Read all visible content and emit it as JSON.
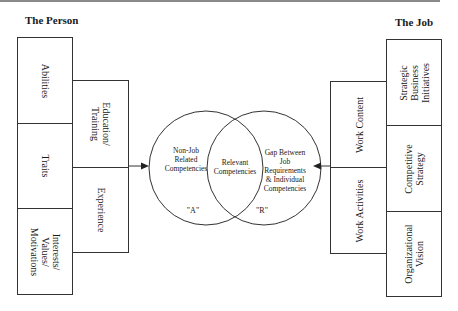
{
  "headings": {
    "left": "The Person",
    "right": "The Job"
  },
  "person": {
    "traits_column": [
      {
        "id": "abilities",
        "lines": [
          "Abilities"
        ]
      },
      {
        "id": "traits",
        "lines": [
          "Traits"
        ]
      },
      {
        "id": "interests",
        "lines": [
          "Interests/",
          "Values/",
          "Motivations"
        ]
      }
    ],
    "development_column": [
      {
        "id": "education",
        "lines": [
          "Education/",
          "Training"
        ]
      },
      {
        "id": "experience",
        "lines": [
          "Experience"
        ]
      }
    ]
  },
  "job": {
    "work_column": [
      {
        "id": "work-content",
        "lines": [
          "Work Content"
        ]
      },
      {
        "id": "work-activities",
        "lines": [
          "Work Activities"
        ]
      }
    ],
    "strategy_column": [
      {
        "id": "strategic",
        "lines": [
          "Strategic",
          "Business",
          "Initiatives"
        ]
      },
      {
        "id": "competitive",
        "lines": [
          "Competitive",
          "Strategy"
        ]
      },
      {
        "id": "organizational",
        "lines": [
          "Organizational",
          "Vision"
        ]
      }
    ]
  },
  "venn": {
    "left": {
      "lines": [
        "Non-Job",
        "Related",
        "Competencies"
      ],
      "label": "\"A\""
    },
    "center": {
      "lines": [
        "Relevant",
        "Competencies"
      ]
    },
    "right": {
      "lines": [
        "Gap Between",
        "Job",
        "Requirements",
        "& Individual",
        "Competencies"
      ],
      "label": "\"R\""
    }
  },
  "colors": {
    "line": "#333333",
    "top_rule": "#8a8a8a"
  }
}
